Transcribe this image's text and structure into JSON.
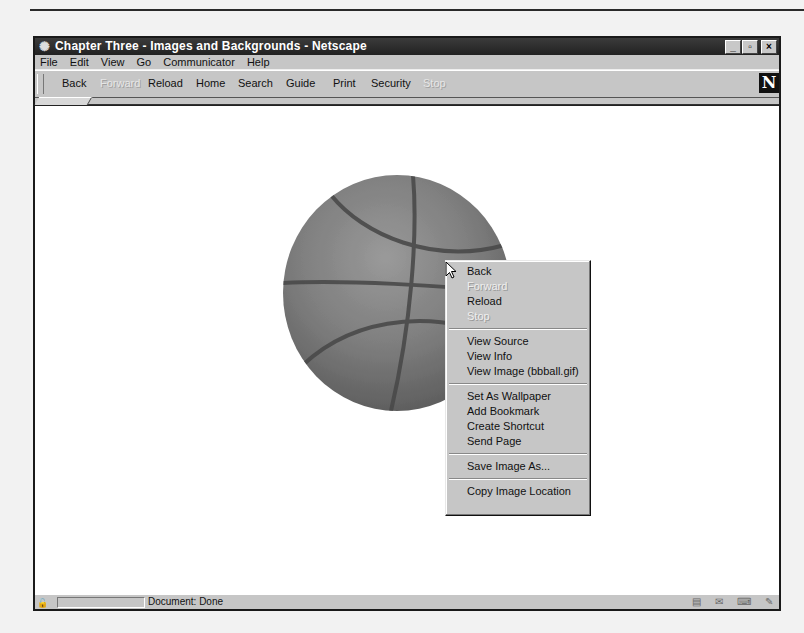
{
  "window": {
    "title": "Chapter Three - Images and Backgrounds - Netscape",
    "app_icon": "netscape-app-icon",
    "controls": {
      "minimize": "_",
      "maximize": "▫",
      "close": "×"
    }
  },
  "menubar": {
    "items": [
      {
        "label": "File",
        "mnemonic": "F"
      },
      {
        "label": "Edit",
        "mnemonic": "E"
      },
      {
        "label": "View",
        "mnemonic": "V"
      },
      {
        "label": "Go",
        "mnemonic": "G"
      },
      {
        "label": "Communicator",
        "mnemonic": "C"
      },
      {
        "label": "Help",
        "mnemonic": "H"
      }
    ]
  },
  "toolbar": {
    "buttons": [
      {
        "label": "Back",
        "enabled": true
      },
      {
        "label": "Forward",
        "enabled": false
      },
      {
        "label": "Reload",
        "enabled": true
      },
      {
        "label": "Home",
        "enabled": true
      },
      {
        "label": "Search",
        "enabled": true
      },
      {
        "label": "Guide",
        "enabled": true
      },
      {
        "label": "Print",
        "enabled": true
      },
      {
        "label": "Security",
        "enabled": true
      },
      {
        "label": "Stop",
        "enabled": false
      }
    ],
    "throbber": "N"
  },
  "content": {
    "image": "bbball.gif",
    "image_description": "basketball-image"
  },
  "context_menu": {
    "items": [
      {
        "label": "Back",
        "mnemonic": "B",
        "enabled": true
      },
      {
        "label": "Forward",
        "mnemonic": "F",
        "enabled": false
      },
      {
        "label": "Reload",
        "mnemonic": "R",
        "enabled": true
      },
      {
        "label": "Stop",
        "mnemonic": "S",
        "enabled": false
      },
      {
        "separator": true
      },
      {
        "label": "View Source",
        "mnemonic": "u",
        "enabled": true
      },
      {
        "label": "View Info",
        "mnemonic": "V",
        "enabled": true
      },
      {
        "label": "View Image (bbball.gif)",
        "mnemonic": "I",
        "enabled": true
      },
      {
        "separator": true
      },
      {
        "label": "Set As Wallpaper",
        "mnemonic": "W",
        "enabled": true
      },
      {
        "label": "Add Bookmark",
        "mnemonic": "k",
        "enabled": true
      },
      {
        "label": "Create Shortcut",
        "mnemonic": "h",
        "enabled": true
      },
      {
        "label": "Send Page",
        "mnemonic": "d",
        "enabled": true
      },
      {
        "separator": true
      },
      {
        "label": "Save Image As...",
        "mnemonic": "I",
        "enabled": true
      },
      {
        "separator": true
      },
      {
        "label": "Copy Image Location",
        "mnemonic": "y",
        "enabled": true
      }
    ]
  },
  "statusbar": {
    "status_text": "Document: Done",
    "icons": [
      "security-lock-icon",
      "navigator-icon",
      "mail-icon",
      "discussion-icon",
      "composer-icon"
    ]
  }
}
